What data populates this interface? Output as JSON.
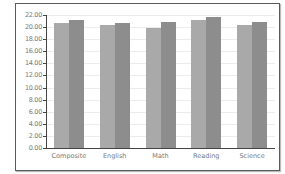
{
  "chart_data": {
    "type": "bar",
    "title": "",
    "xlabel": "",
    "ylabel": "",
    "categories": [
      "Composite",
      "English",
      "Math",
      "Reading",
      "Science"
    ],
    "series": [
      {
        "name": "Series 1",
        "color": "#a9a9a9",
        "values": [
          20.7,
          20.4,
          19.8,
          21.2,
          20.4
        ]
      },
      {
        "name": "Series 2",
        "color": "#8d8d8d",
        "values": [
          21.2,
          20.7,
          20.9,
          21.7,
          20.8
        ]
      }
    ],
    "yticks": [
      "0.00",
      "2.00",
      "4.00",
      "6.00",
      "8.00",
      "10.00",
      "12.00",
      "14.00",
      "16.00",
      "18.00",
      "20.00",
      "22.00"
    ],
    "ylim": [
      0,
      22
    ],
    "grid": true,
    "legend": "none"
  }
}
